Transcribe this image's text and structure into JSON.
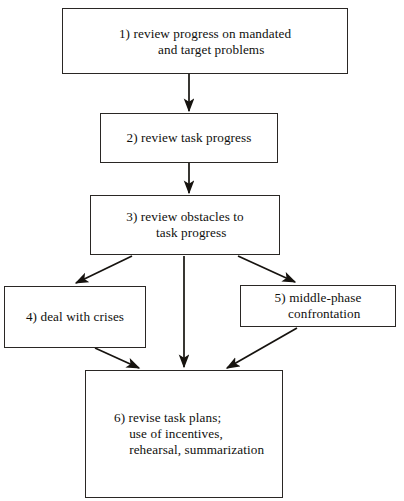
{
  "figure": {
    "type": "flowchart",
    "orientation": "top-to-bottom",
    "background_color": "#ffffff",
    "stroke_color": "#16130f",
    "text_color": "#100f0d"
  },
  "nodes": [
    {
      "id": "1",
      "name": "review-progress",
      "label": "1) review progress on mandated\nand target problems",
      "align": "center"
    },
    {
      "id": "2",
      "name": "review-task-progress",
      "label": "2) review task progress",
      "align": "center"
    },
    {
      "id": "3",
      "name": "review-obstacles",
      "label": "3) review obstacles to\ntask progress",
      "align": "center"
    },
    {
      "id": "4",
      "name": "deal-with-crises",
      "label": "4) deal with crises",
      "align": "center"
    },
    {
      "id": "5",
      "name": "middle-phase-confrontation",
      "label": "5) middle-phase\nconfrontation",
      "align": "center"
    },
    {
      "id": "6",
      "name": "revise-task-plans",
      "label": "6) revise task plans;\nuse of incentives,\nrehearsal, summarization",
      "align": "left"
    }
  ],
  "edges": [
    {
      "from": "1",
      "to": "2",
      "name": "edge-1-to-2",
      "kind": "vertical"
    },
    {
      "from": "2",
      "to": "3",
      "name": "edge-2-to-3",
      "kind": "vertical"
    },
    {
      "from": "3",
      "to": "4",
      "name": "edge-3-to-4",
      "kind": "diagonal-left"
    },
    {
      "from": "3",
      "to": "5",
      "name": "edge-3-to-5",
      "kind": "diagonal-right"
    },
    {
      "from": "3",
      "to": "6",
      "name": "edge-3-to-6",
      "kind": "vertical"
    },
    {
      "from": "4",
      "to": "6",
      "name": "edge-4-to-6",
      "kind": "diagonal-right"
    },
    {
      "from": "5",
      "to": "6",
      "name": "edge-5-to-6",
      "kind": "diagonal-left"
    }
  ]
}
